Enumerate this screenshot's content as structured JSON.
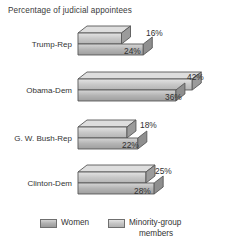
{
  "chart_data": {
    "type": "bar",
    "orientation": "horizontal",
    "style": "3d-grouped-horizontal-bars",
    "title": "Percentage of judicial appointees",
    "xlabel": "",
    "ylabel": "",
    "categories": [
      "Trump-Rep",
      "Obama-Dem",
      "G. W. Bush-Rep",
      "Clinton-Dem"
    ],
    "series": [
      {
        "name": "Women",
        "values": [
          24,
          36,
          22,
          28
        ],
        "value_labels": [
          "24%",
          "36%",
          "22%",
          "28%"
        ],
        "color": "#b0b0b0"
      },
      {
        "name": "Minority-group members",
        "values": [
          16,
          42,
          18,
          25
        ],
        "value_labels": [
          "16%",
          "42%",
          "18%",
          "25%"
        ],
        "color": "#c6c6c6"
      }
    ],
    "xlim": [
      0,
      48
    ],
    "grid": false,
    "axis_visible": false,
    "legend_position": "bottom",
    "legend_entries": [
      "Women",
      "Minority-group members"
    ]
  },
  "chart": {
    "title": "Percentage of judicial appointees",
    "groups": [
      {
        "label": "Trump-Rep",
        "bar_top_label": "24%",
        "bar_bottom_label": "16%",
        "bar_top_value": 24,
        "bar_bottom_value": 16
      },
      {
        "label": "Obama-Dem",
        "bar_top_label": "42%",
        "bar_bottom_label": "36%",
        "bar_top_value": 42,
        "bar_bottom_value": 36
      },
      {
        "label": "G. W. Bush-Rep",
        "bar_top_label": "22%",
        "bar_bottom_label": "18%",
        "bar_top_value": 22,
        "bar_bottom_value": 18
      },
      {
        "label": "Clinton-Dem",
        "bar_top_label": "28%",
        "bar_bottom_label": "25%",
        "bar_top_value": 28,
        "bar_bottom_value": 25
      }
    ],
    "legend": {
      "women_label": "Women",
      "minority_label_line1": "Minority-group",
      "minority_label_line2": "members"
    },
    "colors": {
      "women_swatch": "#b0b0b0",
      "minority_swatch": "#c6c6c6",
      "bar_outline": "#555555",
      "text": "#333333",
      "background": "#ffffff"
    }
  }
}
